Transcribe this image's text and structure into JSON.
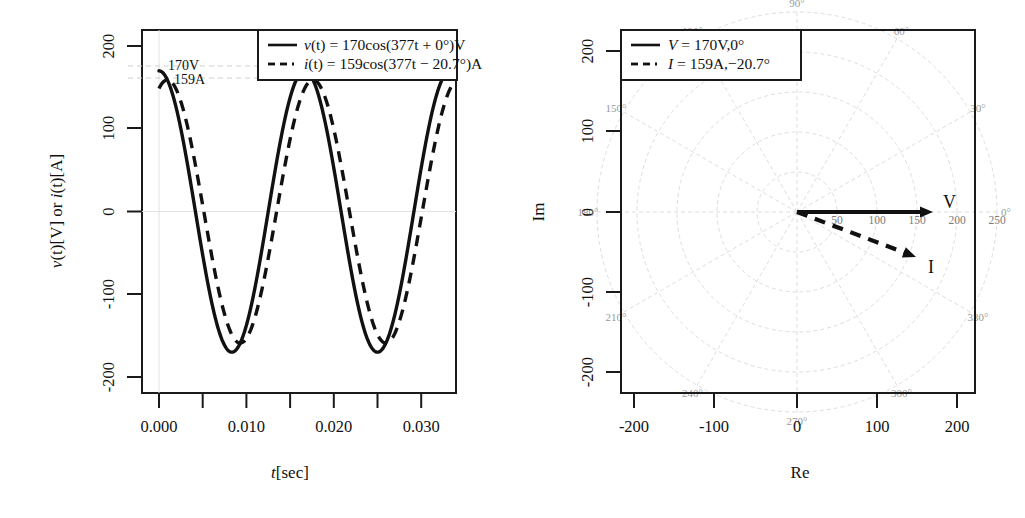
{
  "figure": {
    "panels": [
      "time-domain-waveforms",
      "phasor-polar-diagram"
    ]
  },
  "left_plot": {
    "ylabel_parts": {
      "v": "v",
      "t1": "(t)",
      "unit1": "[V] or ",
      "i": "i",
      "t2": "(t)",
      "unit2": "[A]"
    },
    "ylabel_plain": "v(t)[V] or i(t)[A]",
    "xlabel_parts": {
      "t": "t",
      "unit": "[sec]"
    },
    "xlabel_plain": "t[sec]",
    "ytick_labels": [
      "200",
      "100",
      "0",
      "-100",
      "-200"
    ],
    "ytick_values": [
      200,
      100,
      0,
      -100,
      -200
    ],
    "xtick_labels": [
      "0.000",
      "0.010",
      "0.020",
      "0.030"
    ],
    "xtick_values": [
      0.0,
      0.01,
      0.02,
      0.03
    ],
    "xtick_minor_values": [
      0.005,
      0.015,
      0.025
    ],
    "annotations": [
      {
        "text": "170V",
        "value": 170,
        "unit": "V"
      },
      {
        "text": "159A",
        "value": 159,
        "unit": "A"
      }
    ],
    "legend": [
      {
        "style": "solid",
        "label": "v(t) = 170cos(377t + 0°)V",
        "italic_head": "v",
        "rest": "(t) = 170cos(377t + 0°)V"
      },
      {
        "style": "dashed",
        "label": "i(t) = 159cos(377t − 20.7°)A",
        "italic_head": "i",
        "rest": "(t) = 159cos(377t − 20.7°)A"
      }
    ]
  },
  "right_plot": {
    "ylabel": "Im",
    "xlabel": "Re",
    "ytick_labels": [
      "200",
      "100",
      "0",
      "-100",
      "-200"
    ],
    "ytick_values": [
      200,
      100,
      0,
      -100,
      -200
    ],
    "xtick_labels": [
      "-200",
      "-100",
      "0",
      "100",
      "200"
    ],
    "xtick_values": [
      -200,
      -100,
      0,
      100,
      200
    ],
    "polar_angle_labels": [
      "0°",
      "30°",
      "60°",
      "90°",
      "120°",
      "150°",
      "180°",
      "210°",
      "240°",
      "270°",
      "300°",
      "330°"
    ],
    "polar_angle_values": [
      0,
      30,
      60,
      90,
      120,
      150,
      180,
      210,
      240,
      270,
      300,
      330
    ],
    "polar_radial_labels": [
      "50",
      "100",
      "150",
      "200",
      "250"
    ],
    "polar_radial_values": [
      50,
      100,
      150,
      200,
      250
    ],
    "vectors": [
      {
        "name": "V",
        "label": "V",
        "magnitude": 170,
        "angle_deg": 0,
        "style": "solid"
      },
      {
        "name": "I",
        "label": "I",
        "magnitude": 159,
        "angle_deg": -20.7,
        "style": "dashed"
      }
    ],
    "legend": [
      {
        "style": "solid",
        "italic_head": "V",
        "rest": " = 170V,0°",
        "label": "V = 170V,0°"
      },
      {
        "style": "dashed",
        "italic_head": "I",
        "rest": " = 159A,−20.7°",
        "label": "I = 159A,−20.7°"
      }
    ]
  },
  "chart_data": [
    {
      "type": "line",
      "title": "",
      "xlabel": "t[sec]",
      "ylabel": "v(t)[V] or i(t)[A]",
      "xlim": [
        0.0,
        0.034
      ],
      "ylim": [
        -230,
        230
      ],
      "grid": false,
      "legend_position": "top-right",
      "series": [
        {
          "name": "v(t) = 170cos(377t + 0°)V",
          "style": "solid",
          "amplitude": 170,
          "omega": 377,
          "phase_deg": 0,
          "unit": "V"
        },
        {
          "name": "i(t) = 159cos(377t − 20.7°)A",
          "style": "dashed",
          "amplitude": 159,
          "omega": 377,
          "phase_deg": -20.7,
          "unit": "A"
        }
      ],
      "annotations": [
        {
          "text": "170V",
          "x": 0.0,
          "y": 170
        },
        {
          "text": "159A",
          "x": 0.0,
          "y": 159
        }
      ]
    },
    {
      "type": "scatter",
      "subtype": "phasor-polar",
      "title": "",
      "xlabel": "Re",
      "ylabel": "Im",
      "xlim": [
        -230,
        230
      ],
      "ylim": [
        -230,
        230
      ],
      "grid": true,
      "legend_position": "top-left",
      "polar_rings": [
        50,
        100,
        150,
        200,
        250
      ],
      "polar_spokes_deg": [
        0,
        30,
        60,
        90,
        120,
        150,
        180,
        210,
        240,
        270,
        300,
        330
      ],
      "series": [
        {
          "name": "V = 170V,0°",
          "style": "solid",
          "magnitude": 170,
          "angle_deg": 0,
          "re": 170.0,
          "im": 0.0,
          "label": "V"
        },
        {
          "name": "I = 159A,−20.7°",
          "style": "dashed",
          "magnitude": 159,
          "angle_deg": -20.7,
          "re": 148.7,
          "im": -56.2,
          "label": "I"
        }
      ]
    }
  ]
}
